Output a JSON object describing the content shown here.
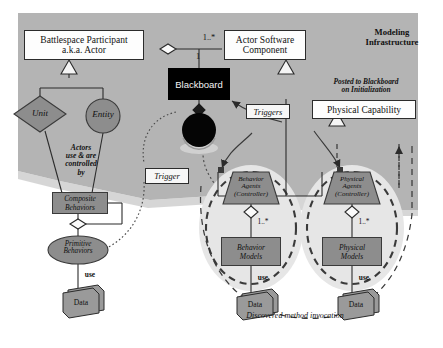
{
  "diagram": {
    "title_note": {
      "line1": "Modeling",
      "line2": "Infrastructure"
    },
    "bottom_note": "Discovered method invocation",
    "posted_note": {
      "line1": "Posted to Blackboard",
      "line2": "on Initialization"
    },
    "actors_note": {
      "line1": "Actors",
      "line2": "use & are",
      "line3": "controlled",
      "line4": "by"
    }
  },
  "nodes": {
    "actor": {
      "line1": "Battlespace Participant",
      "line2": "a.k.a. Actor"
    },
    "actor_software_component": {
      "line1": "Actor Software",
      "line2": "Component"
    },
    "blackboard": {
      "label": "Blackboard"
    },
    "physical_capability": {
      "label": "Physical Capability"
    },
    "unit": {
      "label": "Unit"
    },
    "entity": {
      "label": "Entity"
    },
    "composite_behaviors": {
      "line1": "Composite",
      "line2": "Behaviors"
    },
    "primitive_behaviors": {
      "line1": "Primitive",
      "line2": "Behaviors"
    },
    "behavior_agents": {
      "line1": "Behavior",
      "line2": "Agents",
      "line3": "(Controller)"
    },
    "behavior_models": {
      "line1": "Behavior",
      "line2": "Models"
    },
    "physical_agents": {
      "line1": "Physical",
      "line2": "Agents",
      "line3": "(Controller)"
    },
    "physical_models": {
      "line1": "Physical",
      "line2": "Models"
    },
    "data_left": {
      "label": "Data"
    },
    "data_behavior": {
      "label": "Data"
    },
    "data_physical": {
      "label": "Data"
    }
  },
  "labels": {
    "trigger": "Trigger",
    "triggers": "Triggers",
    "mult_many": "1..*",
    "mult_one": "1",
    "mult_many_behavior": "1..*",
    "mult_many_physical": "1..*",
    "use_left": "use",
    "use_behavior": "use",
    "use_physical": "use"
  },
  "colors": {
    "background": "#ffffff",
    "panel_gray": "#b4b4b4",
    "cluster_halo": "#e3e3e3",
    "shape_fill": "#8d8d8d",
    "blackboard": "#000000",
    "stroke": "#2b2b2b"
  }
}
